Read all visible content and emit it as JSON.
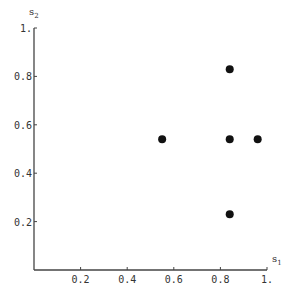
{
  "chart_data": {
    "type": "scatter",
    "title": "",
    "xlabel": "s1",
    "ylabel": "s2",
    "xlim": [
      0,
      1
    ],
    "ylim": [
      0,
      1
    ],
    "grid": false,
    "legend": null,
    "x_ticks": [
      "0.2",
      "0.4",
      "0.6",
      "0.8",
      "1."
    ],
    "y_ticks": [
      "0.2",
      "0.4",
      "0.6",
      "0.8",
      "1."
    ],
    "points": [
      {
        "x": 0.55,
        "y": 0.54
      },
      {
        "x": 0.84,
        "y": 0.83
      },
      {
        "x": 0.84,
        "y": 0.54
      },
      {
        "x": 0.96,
        "y": 0.54
      },
      {
        "x": 0.84,
        "y": 0.23
      }
    ],
    "marker_color": "#111111"
  },
  "axes": {
    "x_label_main": "s",
    "x_label_sub": "1",
    "y_label_main": "s",
    "y_label_sub": "2"
  }
}
